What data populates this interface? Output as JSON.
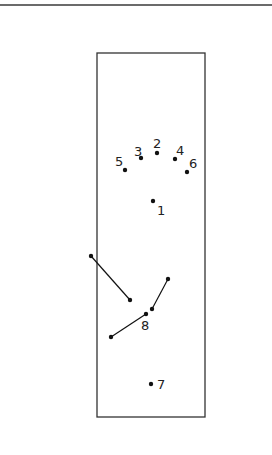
{
  "diagram": {
    "frame": {
      "x": 97,
      "y": 53,
      "width": 108,
      "height": 364,
      "stroke": "#333333"
    },
    "points": [
      {
        "label": "1",
        "x": 153,
        "y": 201,
        "lx": 157,
        "ly": 215
      },
      {
        "label": "2",
        "x": 157,
        "y": 153,
        "lx": 153,
        "ly": 148
      },
      {
        "label": "3",
        "x": 141,
        "y": 158,
        "lx": 134,
        "ly": 156
      },
      {
        "label": "4",
        "x": 175,
        "y": 159,
        "lx": 176,
        "ly": 155
      },
      {
        "label": "5",
        "x": 125,
        "y": 170,
        "lx": 115,
        "ly": 166
      },
      {
        "label": "6",
        "x": 187,
        "y": 172,
        "lx": 189,
        "ly": 168
      },
      {
        "label": "7",
        "x": 151,
        "y": 384,
        "lx": 157,
        "ly": 389
      },
      {
        "label": "8",
        "x": 146,
        "y": 314,
        "lx": 141,
        "ly": 330
      }
    ],
    "segments": [
      {
        "x1": 91,
        "y1": 256,
        "x2": 130,
        "y2": 300
      },
      {
        "x1": 111,
        "y1": 337,
        "x2": 146,
        "y2": 314
      },
      {
        "x1": 152,
        "y1": 309,
        "x2": 168,
        "y2": 279
      }
    ],
    "labels": {
      "p1": "1",
      "p2": "2",
      "p3": "3",
      "p4": "4",
      "p5": "5",
      "p6": "6",
      "p7": "7",
      "p8": "8"
    }
  }
}
